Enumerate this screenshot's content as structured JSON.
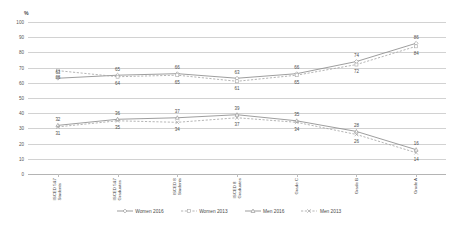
{
  "chart_data": {
    "type": "line",
    "title": "",
    "subtitle": "",
    "xlabel": "",
    "ylabel": "%",
    "ylim": [
      0,
      100
    ],
    "ytick_step": 10,
    "yticks": [
      "0",
      "10",
      "20",
      "30",
      "40",
      "50",
      "60",
      "70",
      "80",
      "90",
      "100"
    ],
    "grid": true,
    "legend_position": "bottom",
    "categories": [
      "ISCED 5&7\nStudents",
      "ISCED 5&7\nGraduates",
      "ISCED 8\nStudents",
      "ISCED 8\nGraduates",
      "Grade C",
      "Grade B",
      "Grade A"
    ],
    "series": [
      {
        "name": "Women 2016",
        "color": "#8c8c8c",
        "style": "solid",
        "marker": "diamond",
        "values": [
          63,
          65,
          66,
          63,
          66,
          74,
          86
        ],
        "label_positions": [
          "above",
          "above",
          "above",
          "above",
          "above",
          "above",
          "above"
        ]
      },
      {
        "name": "Women 2013",
        "color": "#a8a8a8",
        "style": "dashed",
        "marker": "square",
        "values": [
          68,
          64,
          65,
          61,
          65,
          72,
          84
        ],
        "label_positions": [
          "below",
          "below",
          "below",
          "below",
          "below",
          "below",
          "below"
        ]
      },
      {
        "name": "Men 2016",
        "color": "#8c8c8c",
        "style": "solid",
        "marker": "triangle",
        "values": [
          32,
          36,
          37,
          39,
          35,
          28,
          16
        ],
        "label_positions": [
          "above",
          "above",
          "above",
          "above",
          "above",
          "above",
          "above"
        ]
      },
      {
        "name": "Men 2013",
        "color": "#a8a8a8",
        "style": "dashed",
        "marker": "cross",
        "values": [
          31,
          35,
          34,
          37,
          34,
          26,
          14
        ],
        "label_positions": [
          "below",
          "below",
          "below",
          "below",
          "below",
          "below",
          "below"
        ]
      }
    ]
  },
  "axis": {
    "unit_label": "%"
  },
  "legend": {
    "entries": [
      {
        "label": "Women 2016"
      },
      {
        "label": "Women 2013"
      },
      {
        "label": "Men 2016"
      },
      {
        "label": "Men 2013"
      }
    ]
  }
}
